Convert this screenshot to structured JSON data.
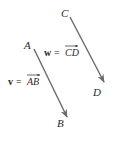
{
  "diagram": {
    "type": "vectors",
    "points": {
      "A": {
        "label": "A"
      },
      "B": {
        "label": "B"
      },
      "C": {
        "label": "C"
      },
      "D": {
        "label": "D"
      }
    },
    "vectors": [
      {
        "name": "v",
        "from": "A",
        "to": "B",
        "equation_lhs": "v",
        "equals": "=",
        "equation_rhs": "AB"
      },
      {
        "name": "w",
        "from": "C",
        "to": "D",
        "equation_lhs": "w",
        "equals": "=",
        "equation_rhs": "CD"
      }
    ],
    "colors": {
      "arrow": "#6a6a6a",
      "text": "#2a2a2a"
    }
  }
}
